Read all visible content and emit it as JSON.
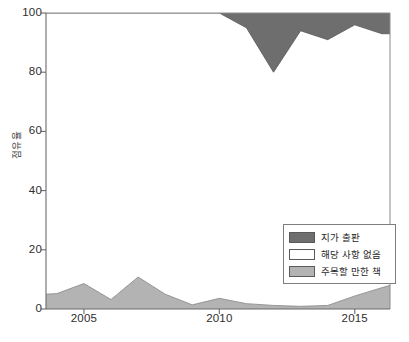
{
  "chart_data": {
    "type": "area",
    "stacked": true,
    "title": "",
    "xlabel": "",
    "ylabel": "점유율",
    "xlim": [
      2003.6,
      2016.3
    ],
    "ylim": [
      0,
      100
    ],
    "grid": false,
    "legend_position": "lower-right",
    "xticks": [
      2005,
      2010,
      2015
    ],
    "xtick_labels": [
      "2005",
      "2010",
      "2015"
    ],
    "yticks": [
      0,
      20,
      40,
      60,
      80,
      100
    ],
    "ytick_labels": [
      "0",
      "20",
      "40",
      "60",
      "80",
      "100"
    ],
    "x": [
      2003.6,
      2004,
      2005,
      2006,
      2007,
      2008,
      2009,
      2010,
      2011,
      2012,
      2013,
      2014,
      2015,
      2016,
      2016.3
    ],
    "series": [
      {
        "name": "주목할 만한 책",
        "color": "#b3b3b3",
        "values": [
          5.0,
          5.2,
          8.6,
          3.2,
          10.8,
          5.0,
          1.4,
          3.6,
          1.8,
          1.2,
          0.9,
          1.2,
          4.4,
          7.2,
          8.0
        ]
      },
      {
        "name": "해당 사항 없음",
        "color": "#ffffff",
        "values": [
          95.0,
          94.8,
          91.4,
          96.8,
          89.2,
          95.0,
          98.6,
          96.4,
          93.2,
          78.8,
          93.1,
          89.8,
          91.6,
          85.8,
          85.0
        ]
      },
      {
        "name": "지가 출판",
        "color": "#6e6e6e",
        "values": [
          0.0,
          0.0,
          0.0,
          0.0,
          0.0,
          0.0,
          0.0,
          0.0,
          5.0,
          20.0,
          6.0,
          9.0,
          4.0,
          7.0,
          7.0
        ]
      }
    ],
    "annotations": []
  },
  "axes": {
    "y_axis_label": "점유율",
    "y_ticks": [
      {
        "label": "100",
        "value": 100
      },
      {
        "label": "80",
        "value": 80
      },
      {
        "label": "60",
        "value": 60
      },
      {
        "label": "40",
        "value": 40
      },
      {
        "label": "20",
        "value": 20
      },
      {
        "label": "0",
        "value": 0
      }
    ],
    "x_ticks": [
      {
        "label": "2005",
        "value": 2005
      },
      {
        "label": "2010",
        "value": 2010
      },
      {
        "label": "2015",
        "value": 2015
      }
    ]
  },
  "legend": {
    "items": [
      {
        "label": "지가 출판",
        "color": "#6e6e6e"
      },
      {
        "label": "해당 사항 없음",
        "color": "#ffffff"
      },
      {
        "label": "주목할 만한 책",
        "color": "#b3b3b3"
      }
    ]
  },
  "caption": {
    "text": ""
  },
  "colors": {
    "axis": "#6b6b6b",
    "plot_border": "#8c8c8c",
    "background": "#ffffff",
    "self_published": "#6e6e6e",
    "not_applicable": "#ffffff",
    "notable_books": "#b3b3b3",
    "text": "#2b2b2b"
  }
}
